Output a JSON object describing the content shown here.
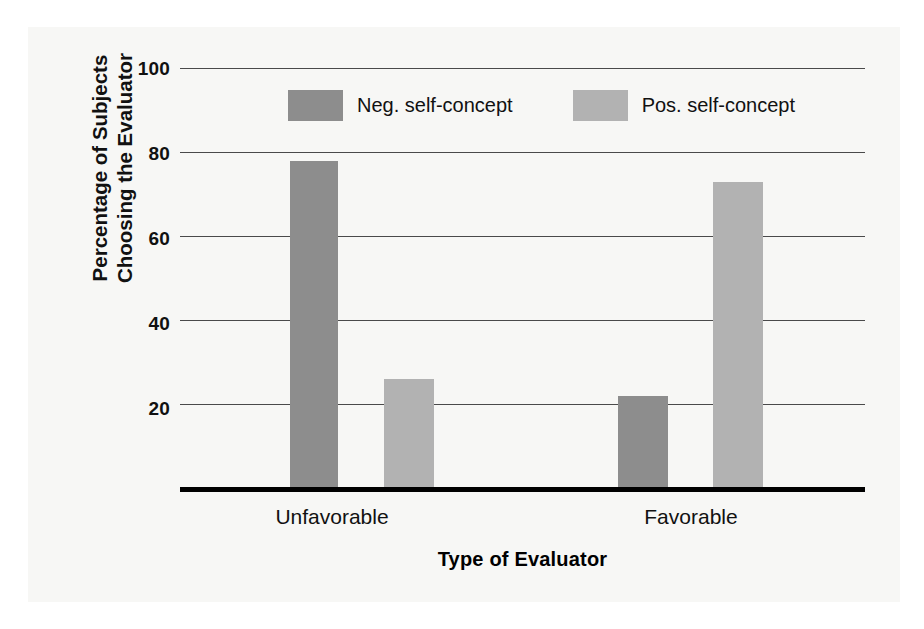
{
  "chart_data": {
    "type": "bar",
    "title": "",
    "xlabel": "Type of Evaluator",
    "ylabel": "Percentage of Subjects Choosing the Evaluator",
    "ylabel_line1": "Percentage of Subjects",
    "ylabel_line2": "Choosing the Evaluator",
    "categories": [
      "Unfavorable",
      "Favorable"
    ],
    "series": [
      {
        "name": "Neg. self-concept",
        "values": [
          78,
          22
        ],
        "color": "#8d8d8d"
      },
      {
        "name": "Pos. self-concept",
        "values": [
          26,
          73
        ],
        "color": "#b2b2b2"
      }
    ],
    "ylim": [
      0,
      100
    ],
    "yticks": [
      100,
      80,
      60,
      40,
      20
    ],
    "ytick_labels": [
      "100",
      "80",
      "60",
      "40",
      "20"
    ],
    "grid": true,
    "grid_axis": "y",
    "legend_position": "top-inside"
  },
  "legend": {
    "items": [
      {
        "label": "Neg. self-concept"
      },
      {
        "label": "Pos. self-concept"
      }
    ]
  },
  "axes": {
    "x_tick_labels": [
      "Unfavorable",
      "Favorable"
    ],
    "x_title": "Type of Evaluator",
    "y_tick_labels": [
      "100",
      "80",
      "60",
      "40",
      "20"
    ],
    "y_title_line1": "Percentage of Subjects",
    "y_title_line2": "Choosing the Evaluator"
  },
  "colors": {
    "neg_self_concept": "#8d8d8d",
    "pos_self_concept": "#b2b2b2",
    "gridline": "#4a4a4a",
    "axis": "#000000",
    "background": "#ffffff",
    "panel": "#f7f7f5"
  }
}
